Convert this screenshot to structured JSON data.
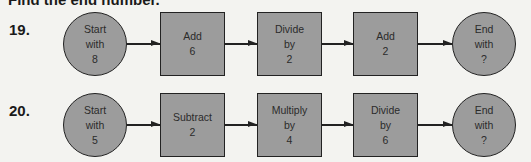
{
  "header": {
    "title": "Find the end number."
  },
  "problems": [
    {
      "number": "19.",
      "start": {
        "line1": "Start",
        "line2": "with",
        "line3": "8"
      },
      "steps": [
        {
          "line1": "Add",
          "line2": "6",
          "line3": ""
        },
        {
          "line1": "Divide",
          "line2": "by",
          "line3": "2"
        },
        {
          "line1": "Add",
          "line2": "2",
          "line3": ""
        }
      ],
      "end": {
        "line1": "End",
        "line2": "with",
        "line3": "?"
      }
    },
    {
      "number": "20.",
      "start": {
        "line1": "Start",
        "line2": "with",
        "line3": "5"
      },
      "steps": [
        {
          "line1": "Subtract",
          "line2": "2",
          "line3": ""
        },
        {
          "line1": "Multiply",
          "line2": "by",
          "line3": "4"
        },
        {
          "line1": "Divide",
          "line2": "by",
          "line3": "6"
        }
      ],
      "end": {
        "line1": "End",
        "line2": "with",
        "line3": "?"
      }
    }
  ],
  "colors": {
    "background": "#f3f3f0",
    "shape_fill": "#9c9c9c",
    "outline": "#222222"
  }
}
